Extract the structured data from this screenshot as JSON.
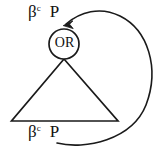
{
  "diagram": {
    "background_color": "#ffffff",
    "stroke_color": "#1a1a1a",
    "nodes": {
      "or_node": {
        "label": "OR",
        "shape": "circle",
        "center": [
          64,
          44
        ],
        "radius": 15
      },
      "subtree_triangle": {
        "shape": "triangle",
        "apex": [
          64,
          59
        ],
        "left_vertex": [
          11,
          121
        ],
        "right_vertex": [
          118,
          121
        ]
      }
    },
    "labels": {
      "top": {
        "symbol": "β",
        "superscript": "c",
        "second": "P",
        "full": "βc P"
      },
      "bottom": {
        "symbol": "β",
        "superscript": "c",
        "second": "P",
        "full": "βc P"
      }
    },
    "edges": [
      {
        "name": "back-edge-arc",
        "from": [
          58,
          143
        ],
        "to": [
          64,
          26
        ],
        "arrowhead": "to",
        "style": "curved"
      },
      {
        "name": "or-to-triangle-apex",
        "from": [
          64,
          59
        ],
        "to": [
          64,
          59
        ],
        "arrowhead": "none",
        "style": "straight"
      }
    ]
  }
}
